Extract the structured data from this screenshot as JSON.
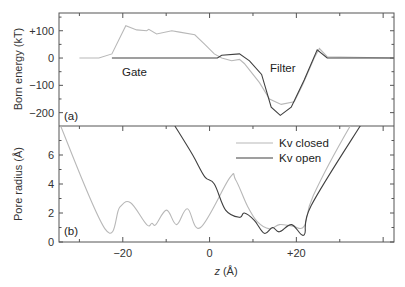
{
  "chart_data": [
    {
      "panel_label": "(a)",
      "type": "line",
      "title": "",
      "xlabel": "z (Å)",
      "ylabel": "Born energy (kT)",
      "xlim": [
        -34.7,
        42.5
      ],
      "ylim": [
        -249,
        165
      ],
      "yticks": [
        100,
        0,
        -100,
        -200
      ],
      "ytick_labels": [
        "+100",
        "0",
        "−100",
        "−200"
      ],
      "annotations": [
        {
          "text": "Gate",
          "z": -8,
          "y": -55
        },
        {
          "text": "Filter",
          "z": 22,
          "y": -35
        }
      ],
      "series": [
        {
          "name": "Kv closed",
          "color": "#b8b8b8",
          "z": [
            -30,
            -25.5,
            -22.5,
            -19.3,
            -16.8,
            -14.5,
            -14,
            -12.2,
            -8.7,
            -6.9,
            -3.4,
            -1.1,
            1.1,
            2.8,
            5.1,
            6.9,
            8,
            11.5,
            13.8,
            16.5,
            19.5,
            21.4,
            24.1,
            25.3,
            27.1,
            42.5
          ],
          "values": [
            0,
            0,
            15,
            118,
            103,
            100,
            105,
            88,
            100,
            95,
            85,
            50,
            15,
            0,
            -10,
            -5,
            -20,
            -90,
            -150,
            -170,
            -160,
            -100,
            0,
            35,
            5,
            0
          ]
        },
        {
          "name": "Kv open",
          "color": "#404040",
          "z": [
            -22.5,
            1.8,
            2.8,
            6.9,
            9.2,
            12,
            14.2,
            16.3,
            18.8,
            21.8,
            24.8,
            27.1,
            42.5
          ],
          "values": [
            0,
            0,
            10,
            15,
            -10,
            -60,
            -180,
            -210,
            -180,
            -80,
            30,
            0,
            0
          ]
        }
      ]
    },
    {
      "panel_label": "(b)",
      "type": "line",
      "title": "",
      "xlabel": "z (Å)",
      "ylabel": "Pore radius (Å)",
      "xlim": [
        -34.7,
        42.5
      ],
      "ylim": [
        0,
        8
      ],
      "xticks": [
        -20,
        0,
        20
      ],
      "xtick_labels": [
        "−20",
        "0",
        "+20"
      ],
      "yticks": [
        0,
        2,
        4,
        6
      ],
      "ytick_labels": [
        "0",
        "2",
        "4",
        "6"
      ],
      "legend": {
        "position": "upper right",
        "entries": [
          "Kv closed",
          "Kv open"
        ]
      },
      "series": [
        {
          "name": "Kv closed",
          "color": "#b8b8b8",
          "z": [
            -35,
            -24.1,
            -20.7,
            -18.2,
            -14.5,
            -13.3,
            -12.4,
            -9.9,
            -7.6,
            -5.1,
            -2.1,
            4.6,
            6,
            8.7,
            11,
            13.8,
            16.1,
            19.1,
            21.8,
            23.9,
            32.4,
            36
          ],
          "values": [
            8.5,
            0.9,
            2.4,
            2.7,
            1.2,
            1.3,
            1.2,
            2.2,
            1.2,
            2.3,
            1.0,
            4.4,
            4.3,
            2.5,
            1.4,
            0.9,
            1.2,
            1.1,
            1.1,
            3.2,
            8.0,
            9.5
          ]
        },
        {
          "name": "Kv open",
          "color": "#404040",
          "z": [
            -8,
            -3.9,
            -1.1,
            1.1,
            3.7,
            6.9,
            8,
            10.3,
            12.6,
            14.5,
            16.1,
            18.9,
            21.8,
            23.4,
            34.7,
            37
          ],
          "values": [
            8.0,
            6.0,
            4.5,
            4.0,
            2.2,
            1.7,
            2.0,
            1.5,
            0.6,
            1.0,
            0.7,
            1.2,
            0.5,
            2.5,
            8.0,
            9.0
          ]
        }
      ]
    }
  ],
  "labels": {
    "panel_a": "(a)",
    "panel_b": "(b)",
    "top_ylabel": "Born energy (kT)",
    "bottom_ylabel": "Pore radius (Å)",
    "xlabel_italic": "z",
    "xlabel_unit": " (Å)",
    "gate": "Gate",
    "filter": "Filter",
    "legend_closed": "Kv closed",
    "legend_open": "Kv open"
  }
}
